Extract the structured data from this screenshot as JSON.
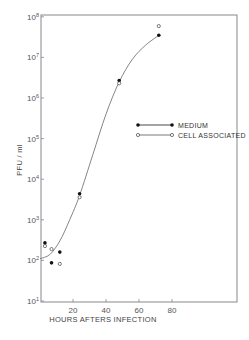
{
  "chart_data": {
    "type": "scatter",
    "title": "",
    "xlabel": "HOURS AFTERS INFECTION",
    "ylabel": "PFU / ml",
    "xlim": [
      0,
      120
    ],
    "ylim": [
      10,
      100000000
    ],
    "yscale": "log",
    "x_ticks": [
      20,
      40,
      60,
      80
    ],
    "x_tick_labels": [
      "20",
      "40",
      "60",
      "80"
    ],
    "y_ticks": [
      10,
      100,
      1000,
      10000,
      100000,
      1000000,
      10000000,
      100000000
    ],
    "y_tick_labels": [
      "10^1",
      "10^2",
      "10^3",
      "10^4",
      "10^5",
      "10^6",
      "10^7",
      "10^8"
    ],
    "grid": false,
    "legend_position": "right-middle",
    "series": [
      {
        "name": "MEDIUM",
        "marker": "filled-circle",
        "points": [
          {
            "x": 3,
            "y": 270
          },
          {
            "x": 7,
            "y": 87
          },
          {
            "x": 12,
            "y": 160
          },
          {
            "x": 24,
            "y": 4400
          },
          {
            "x": 48,
            "y": 2700000
          },
          {
            "x": 72,
            "y": 35000000
          }
        ]
      },
      {
        "name": "CELL ASSOCIATED",
        "marker": "open-circle",
        "points": [
          {
            "x": 3,
            "y": 225
          },
          {
            "x": 7,
            "y": 190
          },
          {
            "x": 12,
            "y": 82
          },
          {
            "x": 24,
            "y": 3600
          },
          {
            "x": 48,
            "y": 2300000
          },
          {
            "x": 72,
            "y": 59000000
          }
        ]
      }
    ],
    "fit_curve": {
      "description": "smooth sigmoid growth curve through data",
      "points": [
        {
          "x": 0,
          "y": 110
        },
        {
          "x": 6,
          "y": 140
        },
        {
          "x": 12,
          "y": 300
        },
        {
          "x": 18,
          "y": 1000
        },
        {
          "x": 24,
          "y": 4000
        },
        {
          "x": 32,
          "y": 40000
        },
        {
          "x": 40,
          "y": 400000
        },
        {
          "x": 48,
          "y": 2500000
        },
        {
          "x": 56,
          "y": 9000000
        },
        {
          "x": 64,
          "y": 20000000
        },
        {
          "x": 72,
          "y": 35000000
        }
      ]
    }
  },
  "labels": {
    "xlabel": "HOURS AFTERS INFECTION",
    "ylabel": "PFU / ml",
    "legend_medium": "MEDIUM",
    "legend_cell": "CELL ASSOCIATED"
  }
}
